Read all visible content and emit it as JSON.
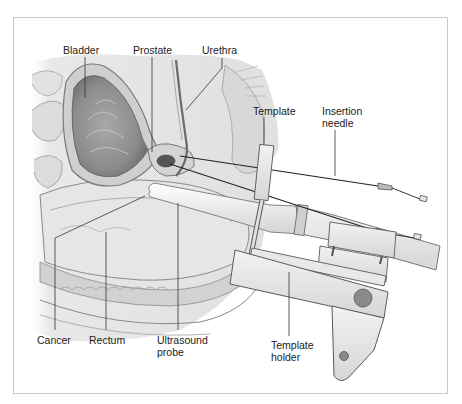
{
  "figure": {
    "labels": {
      "bladder": "Bladder",
      "prostate": "Prostate",
      "urethra": "Urethra",
      "template": "Template",
      "insertion_needle": [
        "Insertion",
        "needle"
      ],
      "cancer": "Cancer",
      "rectum": "Rectum",
      "ultrasound_probe": [
        "Ultrasound",
        "probe"
      ],
      "template_holder": [
        "Template",
        "holder"
      ]
    },
    "colors": {
      "frame": "#c8c8c8",
      "tissue_light": "#e6e6e6",
      "tissue_mid": "#bdbdbd",
      "tissue_dark": "#7a7a7a",
      "cancer": "#555555",
      "device": "#e4e4e4",
      "device_edge": "#5a5a5a",
      "knob": "#8a8a8a",
      "leader": "#333333"
    }
  }
}
